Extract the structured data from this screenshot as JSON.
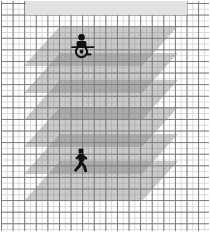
{
  "diagram": {
    "title": "Stacked occupancy planes over grid",
    "type": "layered-plane-diagram",
    "canvas": {
      "width_px": 210,
      "height_px": 232,
      "background_color": "#ffffff"
    },
    "grid": {
      "name": "graph-paper-grid",
      "major_spacing_px": 11.6,
      "minor_spacing_px": 5.8,
      "major_line_color": "#7a7a7a",
      "minor_line_color": "#d8d8d8",
      "visible": true
    },
    "header_band": {
      "name": "top-band",
      "label": "",
      "color": "#e2e2e2",
      "x_px": 26,
      "y_px": 1,
      "width_px": 161,
      "height_px": 14
    },
    "planes": [
      {
        "id": "plane-1",
        "label": "",
        "left_px": 24,
        "top_px": 26,
        "width_px": 118,
        "height_px": 40,
        "fill": "#808080",
        "opacity": 0.42
      },
      {
        "id": "plane-2",
        "label": "",
        "left_px": 24,
        "top_px": 53,
        "width_px": 118,
        "height_px": 40,
        "fill": "#808080",
        "opacity": 0.42
      },
      {
        "id": "plane-3",
        "label": "",
        "left_px": 24,
        "top_px": 80,
        "width_px": 118,
        "height_px": 40,
        "fill": "#808080",
        "opacity": 0.42
      },
      {
        "id": "plane-4",
        "label": "",
        "left_px": 24,
        "top_px": 107,
        "width_px": 118,
        "height_px": 40,
        "fill": "#808080",
        "opacity": 0.42
      },
      {
        "id": "plane-5",
        "label": "",
        "left_px": 24,
        "top_px": 134,
        "width_px": 118,
        "height_px": 40,
        "fill": "#808080",
        "opacity": 0.42
      },
      {
        "id": "plane-6",
        "label": "",
        "left_px": 24,
        "top_px": 161,
        "width_px": 118,
        "height_px": 40,
        "fill": "#808080",
        "opacity": 0.42
      }
    ],
    "figures": [
      {
        "id": "figure-wheelchair",
        "icon": "wheelchair-user-icon",
        "label": "",
        "color": "#121212",
        "left_px": 70,
        "top_px": 33,
        "width_px": 26,
        "height_px": 26
      },
      {
        "id": "figure-pedestrian",
        "icon": "walking-person-icon",
        "label": "",
        "color": "#121212",
        "left_px": 70,
        "top_px": 148,
        "width_px": 22,
        "height_px": 26
      }
    ]
  }
}
